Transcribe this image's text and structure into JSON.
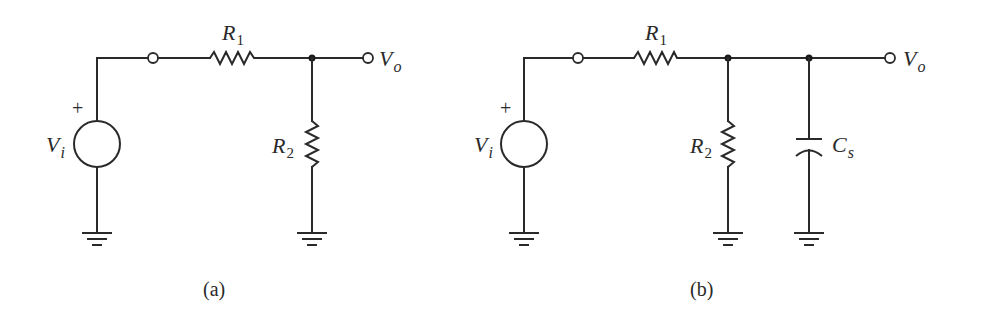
{
  "figures": [
    {
      "id": "a",
      "caption": "(a)",
      "source": {
        "label": "V",
        "subscript": "i",
        "polarity": "+"
      },
      "components": [
        {
          "type": "resistor",
          "label": "R",
          "subscript": "1",
          "orientation": "series"
        },
        {
          "type": "resistor",
          "label": "R",
          "subscript": "2",
          "orientation": "shunt"
        }
      ],
      "output": {
        "label": "V",
        "subscript": "o"
      }
    },
    {
      "id": "b",
      "caption": "(b)",
      "source": {
        "label": "V",
        "subscript": "i",
        "polarity": "+"
      },
      "components": [
        {
          "type": "resistor",
          "label": "R",
          "subscript": "1",
          "orientation": "series"
        },
        {
          "type": "resistor",
          "label": "R",
          "subscript": "2",
          "orientation": "shunt"
        },
        {
          "type": "capacitor",
          "label": "C",
          "subscript": "s",
          "orientation": "shunt"
        }
      ],
      "output": {
        "label": "V",
        "subscript": "o"
      }
    }
  ],
  "colors": {
    "ink": "#2a2a2a",
    "background": "#ffffff"
  }
}
